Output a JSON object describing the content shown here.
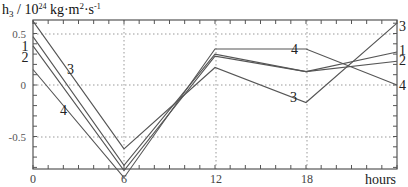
{
  "chart_data": {
    "type": "line",
    "title": "",
    "ylabel": "h3 / 10^24 kg·m²·s⁻¹",
    "ylabel_parts": {
      "main": "h",
      "sub": "3",
      "mid": " / 10",
      "sup": "24",
      "rest": " kg·m",
      "sup2": "2",
      "rest2": "·s",
      "sup3": "-1"
    },
    "xlabel": "hours",
    "x": [
      0,
      6,
      12,
      18,
      24
    ],
    "x_ticks": [
      "0",
      "6",
      "12",
      "18"
    ],
    "y_ticks": [
      "0.5",
      "0",
      "-0.5"
    ],
    "xlim": [
      0,
      24
    ],
    "ylim": [
      -0.82,
      0.63
    ],
    "grid": "dotted",
    "series": [
      {
        "name": "1",
        "values": [
          0.47,
          -0.78,
          0.3,
          0.13,
          0.32
        ]
      },
      {
        "name": "2",
        "values": [
          0.38,
          -0.83,
          0.28,
          0.13,
          0.23
        ]
      },
      {
        "name": "3",
        "values": [
          0.62,
          -0.62,
          0.17,
          -0.17,
          0.6
        ]
      },
      {
        "name": "4",
        "values": [
          0.15,
          -0.9,
          0.35,
          0.35,
          0.0
        ]
      }
    ]
  }
}
